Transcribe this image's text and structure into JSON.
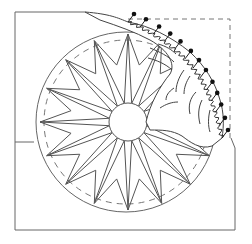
{
  "diagram": {
    "title": "",
    "colors": {
      "background": "#ffffff",
      "stroke": "#555555",
      "dark_stroke": "#222222",
      "pin_head": "#111111"
    },
    "frame": {
      "x": 15,
      "y": 12,
      "width": 220,
      "height": 218
    },
    "circle": {
      "cx": 126,
      "cy": 122,
      "r": 90
    },
    "center_circle": {
      "cx": 128,
      "cy": 122,
      "r": 19
    },
    "star_points": 16,
    "dashed_inner_circle_r": 82,
    "pin_count": 13
  }
}
